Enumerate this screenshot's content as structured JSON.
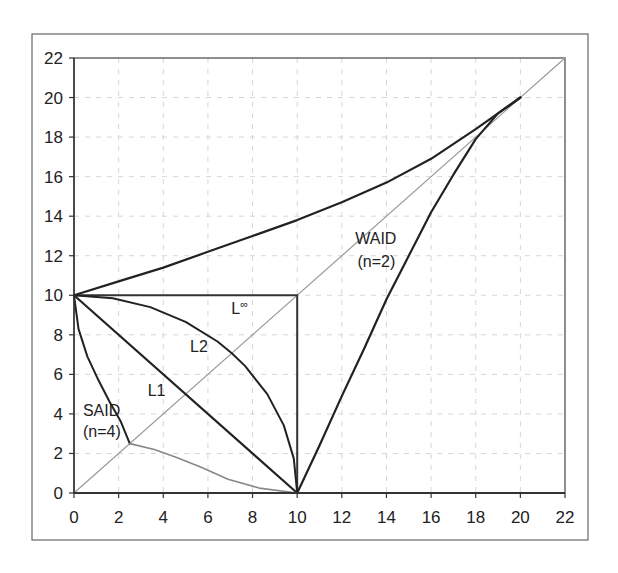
{
  "chart_data": {
    "type": "line",
    "title": "",
    "xlabel": "",
    "ylabel": "",
    "xlim": [
      0,
      22
    ],
    "ylim": [
      0,
      22
    ],
    "x_ticks": [
      "0",
      "2",
      "4",
      "6",
      "8",
      "10",
      "12",
      "14",
      "16",
      "18",
      "20",
      "22"
    ],
    "y_ticks": [
      "0",
      "2",
      "4",
      "6",
      "8",
      "10",
      "12",
      "14",
      "16",
      "18",
      "20",
      "22"
    ],
    "grid": true,
    "legend": "none",
    "series": [
      {
        "name": "diagonal",
        "color": "#999999",
        "width": 1.2,
        "points": [
          [
            0,
            0
          ],
          [
            22,
            22
          ]
        ]
      },
      {
        "name": "L-infinity",
        "color": "#333333",
        "width": 2,
        "points": [
          [
            0,
            10
          ],
          [
            10,
            10
          ],
          [
            10,
            0
          ]
        ]
      },
      {
        "name": "L1",
        "color": "#222222",
        "width": 2.2,
        "points": [
          [
            0,
            10
          ],
          [
            10,
            0
          ]
        ]
      },
      {
        "name": "L2",
        "color": "#222222",
        "width": 2,
        "points": [
          [
            0,
            10
          ],
          [
            1.74,
            9.85
          ],
          [
            3.42,
            9.4
          ],
          [
            5,
            8.66
          ],
          [
            6.43,
            7.66
          ],
          [
            7.07,
            7.07
          ],
          [
            7.66,
            6.43
          ],
          [
            8.66,
            5
          ],
          [
            9.4,
            3.42
          ],
          [
            9.85,
            1.74
          ],
          [
            10,
            0
          ]
        ]
      },
      {
        "name": "SAID (n=4) upper",
        "color": "#222222",
        "width": 2,
        "points": [
          [
            0,
            10
          ],
          [
            0.2,
            8.3
          ],
          [
            0.6,
            6.9
          ],
          [
            1.1,
            5.7
          ],
          [
            1.6,
            4.6
          ],
          [
            2.1,
            3.6
          ],
          [
            2.5,
            2.5
          ]
        ]
      },
      {
        "name": "SAID (n=4) lower",
        "color": "#888888",
        "width": 1.6,
        "points": [
          [
            2.5,
            2.5
          ],
          [
            3.6,
            2.2
          ],
          [
            4.6,
            1.8
          ],
          [
            5.7,
            1.3
          ],
          [
            6.9,
            0.7
          ],
          [
            8.3,
            0.25
          ],
          [
            10,
            0
          ]
        ]
      },
      {
        "name": "WAID (n=2) upper",
        "color": "#222222",
        "width": 2.2,
        "points": [
          [
            0,
            10
          ],
          [
            2,
            10.7
          ],
          [
            4,
            11.4
          ],
          [
            6,
            12.2
          ],
          [
            8,
            13.0
          ],
          [
            10,
            13.8
          ],
          [
            12,
            14.7
          ],
          [
            14,
            15.7
          ],
          [
            16,
            16.9
          ],
          [
            18,
            18.4
          ],
          [
            19,
            19.2
          ],
          [
            20,
            20
          ]
        ]
      },
      {
        "name": "WAID (n=2) lower",
        "color": "#222222",
        "width": 2.2,
        "points": [
          [
            10,
            0
          ],
          [
            11,
            2.4
          ],
          [
            12,
            4.9
          ],
          [
            13,
            7.3
          ],
          [
            14,
            9.8
          ],
          [
            15,
            12.0
          ],
          [
            16,
            14.2
          ],
          [
            17,
            16.1
          ],
          [
            18,
            17.9
          ],
          [
            19,
            19.2
          ],
          [
            20,
            20
          ]
        ]
      }
    ],
    "annotations": [
      {
        "id": "waid",
        "text": "WAID",
        "x": 12.6,
        "y": 12.6
      },
      {
        "id": "waid_n",
        "text": "(n=2)",
        "x": 12.7,
        "y": 11.45
      },
      {
        "id": "linf",
        "text": "L",
        "sup": "∞",
        "x": 7.05,
        "y": 9.05
      },
      {
        "id": "l2",
        "text": "L2",
        "x": 5.2,
        "y": 7.15
      },
      {
        "id": "l1",
        "text": "L1",
        "x": 3.3,
        "y": 4.9
      },
      {
        "id": "said",
        "text": "SAID",
        "x": 0.4,
        "y": 3.9
      },
      {
        "id": "said_n",
        "text": "(n=4)",
        "x": 0.4,
        "y": 2.85
      }
    ]
  }
}
